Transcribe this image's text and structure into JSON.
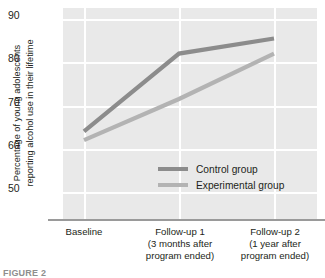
{
  "chart_data": {
    "type": "line",
    "title": "",
    "xlabel": "",
    "ylabel": "Percentage of young adolescents reporting alcohol use in their lifetime",
    "ylabel_line1": "Percentage of young adolescents",
    "ylabel_line2": "reporting alcohol use in their lifetime",
    "categories": [
      "Baseline",
      "Follow-up 1",
      "Follow-up 2"
    ],
    "category_sublabels": [
      [
        ""
      ],
      [
        "(3 months after",
        "program ended)"
      ],
      [
        "(1 year after",
        "program ended)"
      ]
    ],
    "series": [
      {
        "name": "Control group",
        "values": [
          64,
          82,
          85.5
        ],
        "color": "#8c8c8c"
      },
      {
        "name": "Experimental group",
        "values": [
          62,
          71.5,
          82
        ],
        "color": "#b3b3b3"
      }
    ],
    "ylim": [
      50,
      90
    ],
    "yticks": [
      90,
      80,
      70,
      60,
      50
    ],
    "grid": true,
    "legend_position": "inside-center-right"
  },
  "axis": {
    "ytick_labels": [
      "90",
      "80",
      "70",
      "60",
      "50"
    ],
    "xtick_labels": [
      {
        "line1": "Baseline",
        "line2": "",
        "line3": ""
      },
      {
        "line1": "Follow-up 1",
        "line2": "(3 months after",
        "line3": "program ended)"
      },
      {
        "line1": "Follow-up 2",
        "line2": "(1 year after",
        "line3": "program ended)"
      }
    ]
  },
  "legend": {
    "items": [
      {
        "label": "Control group",
        "color": "#8c8c8c"
      },
      {
        "label": "Experimental group",
        "color": "#b3b3b3"
      }
    ]
  },
  "colors": {
    "plot_background": "#e9e9e9",
    "gridline": "#ffffff",
    "axis_line": "#9a9a9a",
    "text": "#231f20",
    "control_series": "#8c8c8c",
    "experimental_series": "#b3b3b3"
  },
  "caption": {
    "text": "FIGURE 2"
  }
}
